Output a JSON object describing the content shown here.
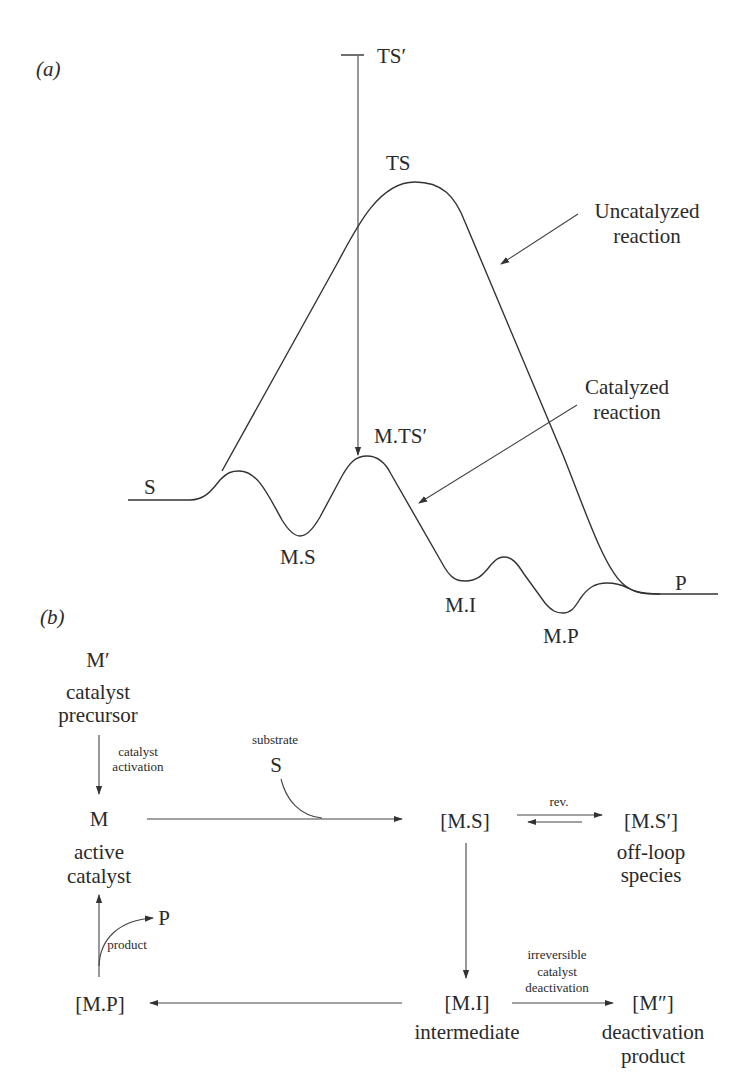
{
  "panel_a": {
    "label": "(a)",
    "title": "Reaction energy profile: uncatalyzed vs catalyzed",
    "states": {
      "S": "S",
      "TS": "TS",
      "TS_prime": "TS′",
      "M_TS_prime": "M.TS′",
      "M_S": "M.S",
      "M_I": "M.I",
      "M_P": "M.P",
      "P": "P"
    },
    "annotations": {
      "uncatalyzed_line1": "Uncatalyzed",
      "uncatalyzed_line2": "reaction",
      "catalyzed_line1": "Catalyzed",
      "catalyzed_line2": "reaction"
    },
    "profile_points": {
      "uncatalyzed": [
        {
          "state": "S",
          "x": 128,
          "y": 500
        },
        {
          "state": "TS",
          "x": 415,
          "y": 182
        },
        {
          "state": "P",
          "x": 718,
          "y": 594
        }
      ],
      "catalyzed": [
        {
          "state": "S",
          "x": 128,
          "y": 500
        },
        {
          "state": "peak1",
          "x": 237,
          "y": 472
        },
        {
          "state": "M.S",
          "x": 300,
          "y": 536
        },
        {
          "state": "M.TS′",
          "x": 367,
          "y": 456
        },
        {
          "state": "M.I",
          "x": 465,
          "y": 581
        },
        {
          "state": "peak3",
          "x": 503,
          "y": 558
        },
        {
          "state": "M.P",
          "x": 563,
          "y": 613
        },
        {
          "state": "peak4",
          "x": 607,
          "y": 583
        },
        {
          "state": "P",
          "x": 718,
          "y": 594
        }
      ]
    }
  },
  "panel_b": {
    "label": "(b)",
    "title": "Catalytic cycle",
    "nodes": {
      "precursor": {
        "symbol": "M′",
        "desc1": "catalyst",
        "desc2": "precursor"
      },
      "active": {
        "symbol": "M",
        "desc1": "active",
        "desc2": "catalyst"
      },
      "ms": {
        "symbol": "[M.S]"
      },
      "ms_prime": {
        "symbol": "[M.S′]",
        "desc1": "off-loop",
        "desc2": "species"
      },
      "mi": {
        "symbol": "[M.I]",
        "desc1": "intermediate"
      },
      "mp": {
        "symbol": "[M.P]"
      },
      "m_double_prime": {
        "symbol": "[M″]",
        "desc1": "deactivation",
        "desc2": "product"
      }
    },
    "edges": {
      "activation_1": "catalyst",
      "activation_2": "activation",
      "substrate_label": "substrate",
      "substrate_symbol": "S",
      "rev_label": "rev.",
      "product_symbol": "P",
      "product_label": "product",
      "deact_1": "irreversible",
      "deact_2": "catalyst",
      "deact_3": "deactivation"
    }
  }
}
